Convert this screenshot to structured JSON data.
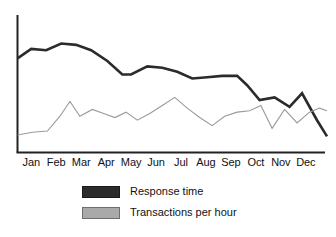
{
  "chart_data": {
    "type": "line",
    "title": "",
    "subtitle": "",
    "xlabel": "",
    "ylabel": "",
    "grid": false,
    "legend_position": "bottom-left",
    "axes": {
      "x_axis_visible": true,
      "y_axis_visible": true,
      "y_tick_labels": [],
      "x_tick_labels": [
        "Jan",
        "Feb",
        "Mar",
        "Apr",
        "May",
        "Jun",
        "Jul",
        "Aug",
        "Sep",
        "Oct",
        "Nov",
        "Dec"
      ],
      "xlim": [
        0,
        12
      ],
      "ylim": [
        0,
        100
      ]
    },
    "categories": [
      "Jan",
      "Feb",
      "Mar",
      "Apr",
      "May",
      "Jun",
      "Jul",
      "Aug",
      "Sep",
      "Oct",
      "Nov",
      "Dec"
    ],
    "series": [
      {
        "name": "Response time",
        "color": "#2b2b2b",
        "line_width": 2.6,
        "x": [
          0.0,
          0.55,
          1.15,
          1.75,
          2.35,
          2.95,
          3.6,
          4.2,
          4.55,
          5.2,
          5.8,
          6.4,
          7.0,
          7.6,
          8.2,
          8.8,
          9.2,
          9.7,
          10.3,
          10.9,
          11.4,
          12.0,
          12.4
        ],
        "values": [
          70,
          77,
          76,
          81,
          80,
          76,
          68,
          58,
          58,
          64,
          63,
          60,
          55,
          56,
          57,
          57,
          50,
          39,
          41,
          34,
          44,
          24,
          12
        ]
      },
      {
        "name": "Transactions per hour",
        "color": "#9a9a9a",
        "line_width": 1.1,
        "x": [
          0.0,
          0.6,
          1.2,
          1.7,
          2.1,
          2.5,
          3.0,
          3.45,
          3.9,
          4.35,
          4.8,
          5.3,
          5.8,
          6.3,
          6.8,
          7.3,
          7.8,
          8.3,
          8.8,
          9.3,
          9.75,
          10.2,
          10.7,
          11.2,
          11.7,
          12.1,
          12.4
        ],
        "values": [
          13,
          15,
          16,
          27,
          38,
          27,
          32,
          29,
          26,
          30,
          24,
          29,
          35,
          41,
          33,
          26,
          20,
          27,
          30,
          31,
          35,
          18,
          32,
          22,
          30,
          33,
          31
        ]
      }
    ]
  },
  "legend": {
    "items": [
      {
        "label": "Response time",
        "swatch": "dark"
      },
      {
        "label": "Transactions per hour",
        "swatch": "gray"
      }
    ]
  }
}
